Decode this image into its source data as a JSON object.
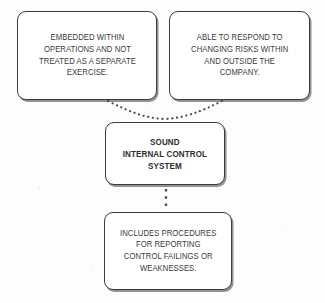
{
  "diagram": {
    "title": "Sound Internal Control System",
    "type": "concept-map",
    "background_color": "#fdfdfd",
    "border_color": "#3b3b3b",
    "text_color": "#3a3a3a",
    "connector_color": "#4a4a4a",
    "nodes": [
      {
        "id": "embedded",
        "role": "attribute",
        "text": "EMBEDDED WITHIN\nOPERATIONS AND NOT\nTREATED AS A SEPARATE\nEXERCISE."
      },
      {
        "id": "respond",
        "role": "attribute",
        "text": "ABLE TO RESPOND TO\nCHANGING RISKS WITHIN\nAND OUTSIDE THE\nCOMPANY."
      },
      {
        "id": "sound",
        "role": "central",
        "text": "SOUND\nINTERNAL CONTROL\nSYSTEM"
      },
      {
        "id": "includes",
        "role": "attribute",
        "text": "INCLUDES PROCEDURES\nFOR REPORTING\nCONTROL FAILINGS OR\nWEAKNESSES."
      }
    ],
    "connectors": [
      {
        "id": "embedded-to-sound",
        "style": "dotted",
        "from": "embedded",
        "to": "sound"
      },
      {
        "id": "respond-to-sound",
        "style": "dotted",
        "from": "respond",
        "to": "sound"
      },
      {
        "id": "sound-to-includes",
        "style": "dotted",
        "from": "sound",
        "to": "includes"
      }
    ]
  }
}
